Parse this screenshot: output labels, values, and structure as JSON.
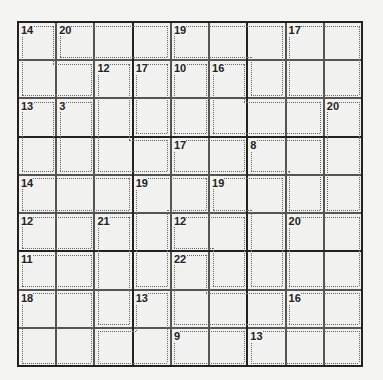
{
  "puzzle": {
    "type": "Killer Sudoku",
    "size": 9,
    "cages": [
      {
        "sum": 14,
        "cells": [
          [
            0,
            0
          ],
          [
            1,
            0
          ],
          [
            1,
            1
          ]
        ]
      },
      {
        "sum": 20,
        "cells": [
          [
            0,
            1
          ],
          [
            0,
            2
          ],
          [
            0,
            3
          ]
        ]
      },
      {
        "sum": 19,
        "cells": [
          [
            0,
            4
          ],
          [
            0,
            5
          ],
          [
            0,
            6
          ],
          [
            1,
            6
          ]
        ]
      },
      {
        "sum": 17,
        "cells": [
          [
            0,
            7
          ],
          [
            0,
            8
          ],
          [
            1,
            7
          ],
          [
            1,
            8
          ]
        ]
      },
      {
        "sum": 12,
        "cells": [
          [
            1,
            2
          ],
          [
            2,
            2
          ],
          [
            3,
            2
          ],
          [
            3,
            3
          ]
        ]
      },
      {
        "sum": 17,
        "cells": [
          [
            1,
            3
          ],
          [
            2,
            3
          ]
        ]
      },
      {
        "sum": 10,
        "cells": [
          [
            1,
            4
          ],
          [
            2,
            4
          ]
        ]
      },
      {
        "sum": 16,
        "cells": [
          [
            1,
            5
          ],
          [
            2,
            5
          ],
          [
            2,
            6
          ],
          [
            2,
            7
          ]
        ]
      },
      {
        "sum": 13,
        "cells": [
          [
            2,
            0
          ],
          [
            3,
            0
          ]
        ]
      },
      {
        "sum": 3,
        "cells": [
          [
            2,
            1
          ],
          [
            3,
            1
          ]
        ]
      },
      {
        "sum": 20,
        "cells": [
          [
            2,
            8
          ],
          [
            3,
            8
          ],
          [
            4,
            8
          ]
        ]
      },
      {
        "sum": 17,
        "cells": [
          [
            3,
            4
          ],
          [
            3,
            5
          ]
        ]
      },
      {
        "sum": 8,
        "cells": [
          [
            3,
            6
          ],
          [
            3,
            7
          ],
          [
            4,
            7
          ]
        ]
      },
      {
        "sum": 14,
        "cells": [
          [
            4,
            0
          ],
          [
            4,
            1
          ],
          [
            4,
            2
          ]
        ]
      },
      {
        "sum": 19,
        "cells": [
          [
            4,
            3
          ],
          [
            4,
            4
          ],
          [
            5,
            3
          ],
          [
            6,
            3
          ]
        ]
      },
      {
        "sum": 19,
        "cells": [
          [
            4,
            5
          ],
          [
            4,
            6
          ],
          [
            5,
            6
          ],
          [
            6,
            6
          ]
        ]
      },
      {
        "sum": 12,
        "cells": [
          [
            5,
            0
          ],
          [
            5,
            1
          ]
        ]
      },
      {
        "sum": 21,
        "cells": [
          [
            5,
            2
          ],
          [
            6,
            2
          ],
          [
            7,
            2
          ]
        ]
      },
      {
        "sum": 12,
        "cells": [
          [
            5,
            4
          ],
          [
            5,
            5
          ],
          [
            6,
            5
          ]
        ]
      },
      {
        "sum": 20,
        "cells": [
          [
            5,
            7
          ],
          [
            5,
            8
          ],
          [
            6,
            7
          ],
          [
            6,
            8
          ]
        ]
      },
      {
        "sum": 11,
        "cells": [
          [
            6,
            0
          ],
          [
            6,
            1
          ]
        ]
      },
      {
        "sum": 22,
        "cells": [
          [
            6,
            4
          ],
          [
            7,
            4
          ],
          [
            7,
            5
          ],
          [
            7,
            6
          ]
        ]
      },
      {
        "sum": 18,
        "cells": [
          [
            7,
            0
          ],
          [
            7,
            1
          ],
          [
            8,
            0
          ],
          [
            8,
            1
          ]
        ]
      },
      {
        "sum": 13,
        "cells": [
          [
            7,
            3
          ],
          [
            8,
            2
          ],
          [
            8,
            3
          ]
        ]
      },
      {
        "sum": 16,
        "cells": [
          [
            7,
            7
          ],
          [
            7,
            8
          ]
        ]
      },
      {
        "sum": 9,
        "cells": [
          [
            8,
            4
          ],
          [
            8,
            5
          ]
        ]
      },
      {
        "sum": 13,
        "cells": [
          [
            8,
            6
          ],
          [
            8,
            7
          ],
          [
            8,
            8
          ]
        ]
      }
    ],
    "values": []
  },
  "colors": {
    "background": "#f4f4f2",
    "grid_line": "#555555",
    "box_line": "#222222",
    "cage_line": "#666666",
    "text": "#222222"
  }
}
